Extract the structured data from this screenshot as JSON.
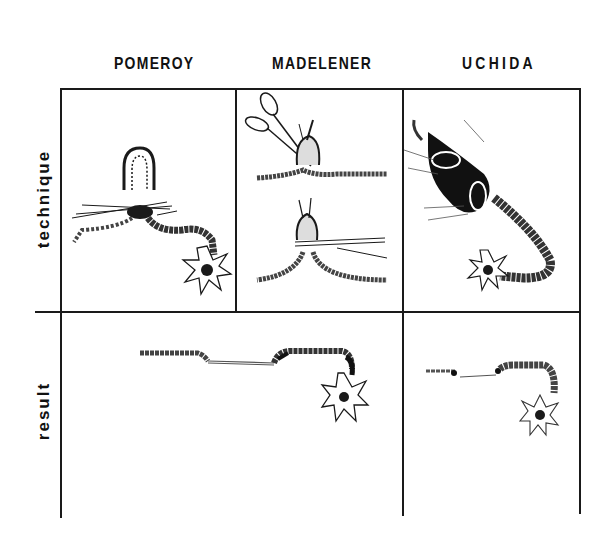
{
  "figure": {
    "columns": [
      {
        "id": "pomeroy",
        "label": "POMEROY"
      },
      {
        "id": "madelener",
        "label": "MADELENER"
      },
      {
        "id": "uchida",
        "label": "UCHIDA"
      }
    ],
    "rows": [
      {
        "id": "technique",
        "label": "technique"
      },
      {
        "id": "result",
        "label": "result"
      }
    ],
    "cells": {
      "technique_pomeroy": {
        "illustration": "tubal loop lifted and ligated with suture, fimbriated end at right"
      },
      "technique_madelener": {
        "illustration": "scissors cutting loop above crushed tube; clamp crushing loop base below"
      },
      "technique_uchida": {
        "illustration": "serosa incised and tube segment excised, fimbriated end at lower right"
      },
      "result_pomeroy_madelener": {
        "illustration": "tube with separated ligated ends, fimbria at right"
      },
      "result_uchida": {
        "illustration": "short tubal gap with buried stumps, fimbria at lower right"
      }
    },
    "colors": {
      "ink": "#1a1a1a",
      "background": "#ffffff"
    }
  }
}
